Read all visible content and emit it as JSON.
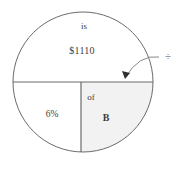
{
  "figure": {
    "type": "circle-diagram",
    "colors": {
      "stroke": "#6b6b6b",
      "fill_shaded": "#f2f2f2",
      "fill_plain": "#ffffff",
      "text": "#3d3d3d",
      "annotation": "#4a4a4a",
      "background": "#ffffff"
    },
    "circle": {
      "center_x": 83,
      "center_y": 82,
      "radius": 70
    },
    "dividers": [
      {
        "name": "horizontal-diameter",
        "orientation": "horizontal",
        "y": 82
      },
      {
        "name": "vertical-radius",
        "orientation": "vertical",
        "x": 81
      }
    ],
    "sectors": [
      {
        "name": "top-half",
        "shaded": false,
        "labels": [
          {
            "name": "is-label",
            "text": "is",
            "x": 84,
            "y": 26
          },
          {
            "name": "amount-label",
            "text": "$1110",
            "x": 82,
            "y": 51
          }
        ]
      },
      {
        "name": "bottom-left-quadrant",
        "shaded": false,
        "labels": [
          {
            "name": "percent-label",
            "text": "6%",
            "x": 52,
            "y": 115
          }
        ]
      },
      {
        "name": "bottom-right-quadrant",
        "shaded": true,
        "labels": [
          {
            "name": "of-label",
            "text": "of",
            "x": 91,
            "y": 97
          },
          {
            "name": "base-label",
            "text": "B",
            "x": 106,
            "y": 118
          }
        ]
      }
    ],
    "annotation": {
      "name": "division-callout",
      "symbol": "÷",
      "symbol_x": 168,
      "symbol_y": 56,
      "arrow": {
        "name": "curved-arrow",
        "start_x": 159,
        "start_y": 57,
        "control_x": 139,
        "control_y": 55,
        "end_x": 125,
        "end_y": 78,
        "arrowhead": "filled-triangle"
      }
    }
  }
}
